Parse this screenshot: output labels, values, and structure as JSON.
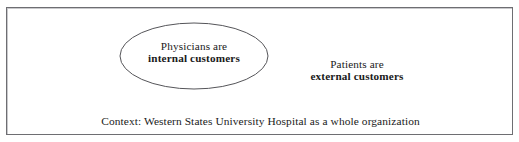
{
  "figure": {
    "type": "venn-style-context-diagram",
    "background_color": "#ffffff",
    "frame_border_color": "#6e6e72",
    "text_color": "#1a1a1a"
  },
  "ellipse": {
    "stroke_color": "#555559",
    "fill_color": "#ffffff",
    "label_line1": "Physicians are",
    "label_line2": "internal customers"
  },
  "outside_label": {
    "line1": "Patients are",
    "line2": "external customers"
  },
  "caption": {
    "text": "Context: Western States University Hospital as a whole organization"
  }
}
